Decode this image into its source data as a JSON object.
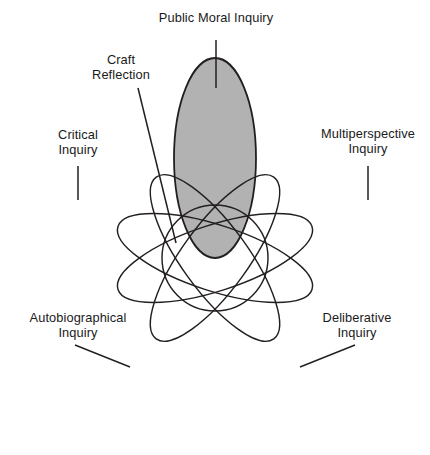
{
  "figure": {
    "background_color": "#ffffff",
    "stroke_color": "#231f20",
    "shaded_fill_color": "#b2b2b2",
    "convergence_point": {
      "x": 215,
      "y": 258
    }
  },
  "diagram_data": {
    "type": "venn-petal",
    "center": {
      "x": 215,
      "y": 258
    },
    "petal_count": 5,
    "petals": [
      {
        "id": "public-moral-inquiry",
        "label": "Public Moral Inquiry",
        "label_lines": [
          "Public Moral Inquiry"
        ],
        "shaded": true,
        "fill": "#b2b2b2",
        "angle_deg": -90,
        "length": 200,
        "width": 82,
        "leader": {
          "type": "vertical",
          "x1": 216,
          "y1": 40,
          "x2": 216,
          "y2": 88
        }
      },
      {
        "id": "critical-inquiry",
        "label": "Critical Inquiry",
        "label_lines": [
          "Critical",
          "Inquiry"
        ],
        "shaded": false,
        "fill": "none",
        "angle_deg": 198,
        "length": 205,
        "width": 66,
        "leader": {
          "type": "vertical",
          "x1": 78,
          "y1": 166,
          "x2": 78,
          "y2": 200
        }
      },
      {
        "id": "multiperspective-inquiry",
        "label": "Multiperspective Inquiry",
        "label_lines": [
          "Multiperspective",
          "Inquiry"
        ],
        "shaded": false,
        "fill": "none",
        "angle_deg": -18,
        "length": 205,
        "width": 66,
        "leader": {
          "type": "vertical",
          "x1": 368,
          "y1": 166,
          "x2": 368,
          "y2": 200
        }
      },
      {
        "id": "autobiographical-inquiry",
        "label": "Autobiographical Inquiry",
        "label_lines": [
          "Autobiographical",
          "Inquiry"
        ],
        "shaded": false,
        "fill": "none",
        "angle_deg": 126,
        "length": 200,
        "width": 66,
        "leader": {
          "type": "diagonal",
          "x1": 75,
          "y1": 345,
          "x2": 130,
          "y2": 367
        }
      },
      {
        "id": "deliberative-inquiry",
        "label": "Deliberative Inquiry",
        "label_lines": [
          "Deliberative",
          "Inquiry"
        ],
        "shaded": false,
        "fill": "none",
        "angle_deg": 54,
        "length": 200,
        "width": 66,
        "leader": {
          "type": "diagonal",
          "x1": 355,
          "y1": 345,
          "x2": 300,
          "y2": 367
        }
      },
      {
        "id": "craft-reflection",
        "label": "Craft Reflection",
        "label_lines": [
          "Craft",
          "Reflection"
        ],
        "shaded": false,
        "is_center_overlap": true,
        "leader": {
          "type": "diagonal",
          "x1": 138,
          "y1": 88,
          "x2": 176,
          "y2": 243
        }
      }
    ]
  },
  "labels": {
    "public_moral_inquiry": {
      "line1": "Public Moral Inquiry",
      "line2": ""
    },
    "craft_reflection": {
      "line1": "Craft",
      "line2": "Reflection"
    },
    "critical_inquiry": {
      "line1": "Critical",
      "line2": "Inquiry"
    },
    "multiperspective_inquiry": {
      "line1": "Multiperspective",
      "line2": "Inquiry"
    },
    "autobiographical_inquiry": {
      "line1": "Autobiographical",
      "line2": "Inquiry"
    },
    "deliberative_inquiry": {
      "line1": "Deliberative",
      "line2": "Inquiry"
    }
  }
}
